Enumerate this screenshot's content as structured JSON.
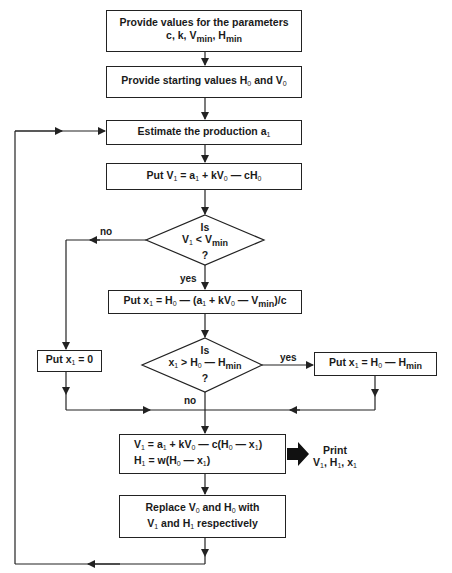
{
  "diagram": {
    "type": "flowchart",
    "steps": {
      "provide_parameters": {
        "line1": "Provide values for the parameters",
        "line2": "c, k, V_min, H_min"
      },
      "provide_start": {
        "text": "Provide starting values H0 and V0"
      },
      "estimate": {
        "text": "Estimate the production a1"
      },
      "put_v1": {
        "text": "Put V1 = a1 + kV0 — cH0"
      },
      "decision1": {
        "line1": "Is",
        "line2": "V1 < V_min",
        "line3": "?"
      },
      "put_x1_formula": {
        "text": "Put x1 = H0 — (a1 + kV0 — V_min)/c"
      },
      "put_x1_zero": {
        "text": "Put x1 = 0"
      },
      "decision2": {
        "line1": "Is",
        "line2": "x1 > H0 — H_min",
        "line3": "?"
      },
      "put_x1_hmin": {
        "text": "Put x1 = H0 — H_min"
      },
      "compute": {
        "line1": "V1 = a1 + kV0 — c(H0 — x1)",
        "line2": "H1 = w(H0 — x1)"
      },
      "print": {
        "line1": "Print",
        "line2": "V1, H1, x1"
      },
      "replace": {
        "line1": "Replace V0 and H0 with",
        "line2": "V1 and H1 respectively"
      }
    },
    "edge_labels": {
      "d1_no": "no",
      "d1_yes": "yes",
      "d2_yes": "yes",
      "d2_no": "no"
    },
    "colors": {
      "line": "#222222",
      "background": "#ffffff"
    }
  }
}
